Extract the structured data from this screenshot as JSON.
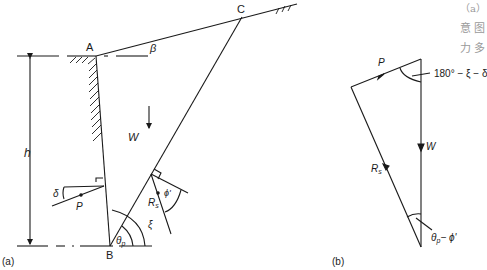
{
  "figure_a": {
    "caption": "(a)",
    "points": {
      "A": "A",
      "B": "B",
      "C": "C"
    },
    "labels": {
      "beta": "β",
      "h": "h",
      "W": "W",
      "P": "P",
      "delta": "δ",
      "Rs": "R",
      "Rs_sub": "s",
      "phi": "ϕ'",
      "xi": "ξ",
      "theta": "θ",
      "theta_sub": "p"
    }
  },
  "figure_b": {
    "caption": "(b)",
    "labels": {
      "P": "P",
      "W": "W",
      "Rs": "R",
      "Rs_sub": "s",
      "top_angle": "180° − ξ − δ",
      "bottom_angle_theta": "θ",
      "bottom_angle_sub": "p",
      "bottom_angle_rest": "− ϕ'"
    }
  },
  "side_text": {
    "line1": "（a）",
    "line2": "意 图",
    "line3": "力 多"
  },
  "colors": {
    "line": "#1a1a1a",
    "faded_text": "#9a9a9a"
  }
}
